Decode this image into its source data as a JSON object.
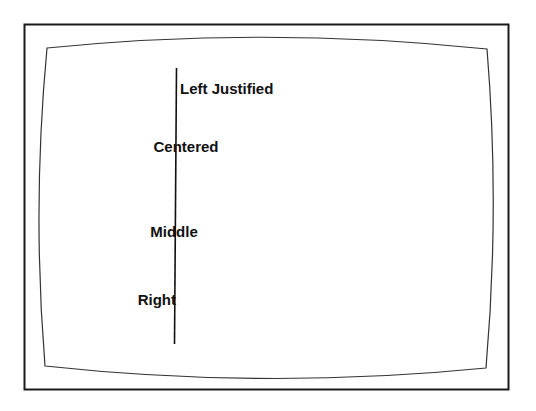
{
  "figure": {
    "type": "text-justification-demo",
    "colors": {
      "background": "#ffffff",
      "stroke": "#1a1a1a",
      "text": "#111111"
    },
    "labels": [
      {
        "id": "left-justified",
        "text": "Left Justified",
        "anchor": "start"
      },
      {
        "id": "centered",
        "text": "Centered",
        "anchor": "middle"
      },
      {
        "id": "middle",
        "text": "Middle",
        "anchor": "middle"
      },
      {
        "id": "right",
        "text": "Right",
        "anchor": "end"
      }
    ]
  }
}
